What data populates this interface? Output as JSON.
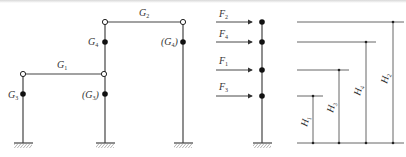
{
  "frame_diagram": {
    "beams": [
      {
        "label": "G",
        "sub": "1"
      },
      {
        "label": "G",
        "sub": "2"
      }
    ],
    "masses": [
      {
        "label": "G",
        "sub": "3",
        "paren": false
      },
      {
        "label": "G",
        "sub": "4",
        "paren": false
      },
      {
        "label": "(G",
        "sub": "3",
        "close": ")"
      },
      {
        "label": "(G",
        "sub": "4",
        "close": ")"
      }
    ]
  },
  "force_diagram": {
    "forces": [
      {
        "label": "F",
        "sub": "2"
      },
      {
        "label": "F",
        "sub": "4"
      },
      {
        "label": "F",
        "sub": "1"
      },
      {
        "label": "F",
        "sub": "3"
      }
    ]
  },
  "height_diagram": {
    "heights": [
      {
        "label": "H",
        "sub": "1"
      },
      {
        "label": "H",
        "sub": "3"
      },
      {
        "label": "H",
        "sub": "4"
      },
      {
        "label": "H",
        "sub": "2"
      }
    ]
  },
  "colors": {
    "line": "#444444",
    "node": "#111111"
  }
}
